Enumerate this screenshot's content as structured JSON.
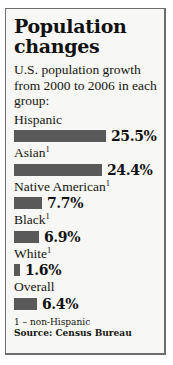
{
  "chart_data": {
    "type": "bar",
    "title": "Population changes",
    "subtitle": "U.S. population growth from 2000 to 2006 in each group:",
    "xlabel": "",
    "ylabel": "",
    "orientation": "horizontal",
    "grid": false,
    "legend": "none",
    "xlim": [
      0,
      25.5
    ],
    "unit": "%",
    "categories": [
      "Hispanic",
      "Asian",
      "Native American",
      "Black",
      "White",
      "Overall"
    ],
    "values": [
      25.5,
      24.4,
      7.7,
      6.9,
      1.6,
      6.4
    ],
    "value_labels": [
      "25.5%",
      "24.4%",
      "7.7%",
      "6.9%",
      "1.6%",
      "6.4%"
    ],
    "footnote_markers": [
      "",
      "1",
      "1",
      "1",
      "1",
      ""
    ],
    "bar_color": "#595959",
    "panel_background": "#f7f7f5",
    "border_color": "#6e6e6e",
    "text_color": "#15150f",
    "bars": [
      {
        "label": "Hispanic",
        "marker": "",
        "value": 25.5,
        "value_label": "25.5%"
      },
      {
        "label": "Asian",
        "marker": "1",
        "value": 24.4,
        "value_label": "24.4%"
      },
      {
        "label": "Native American",
        "marker": "1",
        "value": 7.7,
        "value_label": "7.7%"
      },
      {
        "label": "Black",
        "marker": "1",
        "value": 6.9,
        "value_label": "6.9%"
      },
      {
        "label": "White",
        "marker": "1",
        "value": 1.6,
        "value_label": "1.6%"
      },
      {
        "label": "Overall",
        "marker": "",
        "value": 6.4,
        "value_label": "6.4%"
      }
    ],
    "annotations": [
      "1 – non-Hispanic",
      "Source: Census Bureau"
    ]
  },
  "footnote": {
    "definition": "1 – non-Hispanic",
    "source": "Source: Census Bureau"
  }
}
